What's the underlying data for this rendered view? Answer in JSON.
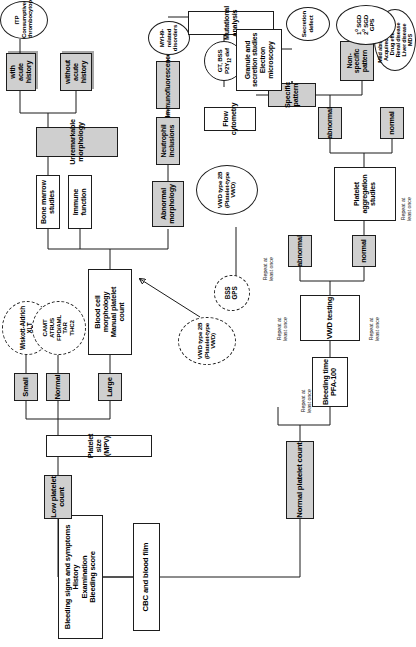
{
  "figure": {
    "kind": "clinical-diagnostic-flowchart",
    "orientation_note": "rotated-90-ccw",
    "accent": "#cfcfcf",
    "line_color": "#1a1a1a"
  },
  "nodes": {
    "clinical_assessment": "Bleeding signs and symptoms\nHistory\nExamination\nBleeding score",
    "clinical_assessment_lines": [
      "Bleeding signs and symptoms",
      "History",
      "Examination",
      "Bleeding score"
    ],
    "cbc": "CBC and blood film",
    "low_platelet_count": "Low platelet count",
    "normal_platelet_count": "Normal platelet count",
    "platelet_size": "Platelet size (MPV)",
    "size_large": "Large",
    "size_normal": "Normal",
    "size_small": "Small",
    "dx_small_lines": [
      "Wiskott-Aldrich",
      "XLT"
    ],
    "dx_normalsize_lines": [
      "CAMT",
      "ATRUS",
      "FPD/AML",
      "TAR",
      "THC2"
    ],
    "blood_cell_morphology_lines": [
      "Blood cell",
      "morphology",
      "Manual platelet",
      "count"
    ],
    "bone_marrow_studies": "Bone marrow studies",
    "immune_function": "Immune function",
    "unremarkable_morphology": "Unremarkable morphology",
    "abnormal_morphology_lines": [
      "Abnormal",
      "morphology"
    ],
    "with_acute_history_lines": [
      "with",
      "acute history"
    ],
    "without_acute_history_lines": [
      "without",
      "acute history"
    ],
    "itp_lines": [
      "ITP",
      "Consumptive",
      "thrombocytopenia"
    ],
    "neutrophil_inclusions": "Neutrophil inclusions",
    "immunofluorescence": "Immunofluorescence",
    "myh9_lines": [
      "MYH9-related",
      "disorders"
    ],
    "mutational_analysis": "Mutational analysis",
    "vwd_2b_dashed_lines": [
      "VWD type 2B",
      "(Platelet-type VWD)"
    ],
    "bss_gps_dashed_lines": [
      "BSS",
      "GPS"
    ],
    "vwd_2b_solid_lines": [
      "VWD type 2B",
      "(Platelet-type VWD)"
    ],
    "bleeding_time_lines": [
      "Bleeding time",
      "PFA-100"
    ],
    "vwd_testing": "VWD testing",
    "vwd_normal": "normal",
    "vwd_abnormal": "abnormal",
    "platelet_aggregation_studies": "Platelet aggregation studies",
    "agg_normal": "normal",
    "agg_abnormal": "abnormal",
    "specific_pattern": "Specific pattern",
    "nonspecific_pattern_lines": [
      "Non-specific",
      "pattern"
    ],
    "nonspecific_dx_lines": [
      "Mild abnormalities",
      "Acquired defects",
      "Drug effects",
      "Renal disease",
      "Liver disease",
      "MDS"
    ],
    "flow_cytometry": "Flow cytometry",
    "flow_dx_lines": [
      "GT, BSS",
      "P2Y12 def"
    ],
    "granule_secretion_lines": [
      "Granule and",
      "secretion studies",
      "Electron",
      "microscopy"
    ],
    "secretion_defect_lines": [
      "Secretion",
      "defect"
    ],
    "sgd_lines": [
      "1° SGD",
      "2° SGD",
      "GPS"
    ],
    "repeat_label_lines": [
      "Repeat at",
      "least once"
    ]
  },
  "repeat_labels": [
    {
      "id": "repeat-bleeding-time",
      "text": "Repeat at least once"
    },
    {
      "id": "repeat-vwd-testing",
      "text": "Repeat at least once"
    },
    {
      "id": "repeat-vwd-normal",
      "text": "Repeat at least once"
    },
    {
      "id": "repeat-aggregation",
      "text": "Repeat at least once"
    },
    {
      "id": "repeat-vwd-2b",
      "text": "Repeat at least once"
    }
  ]
}
